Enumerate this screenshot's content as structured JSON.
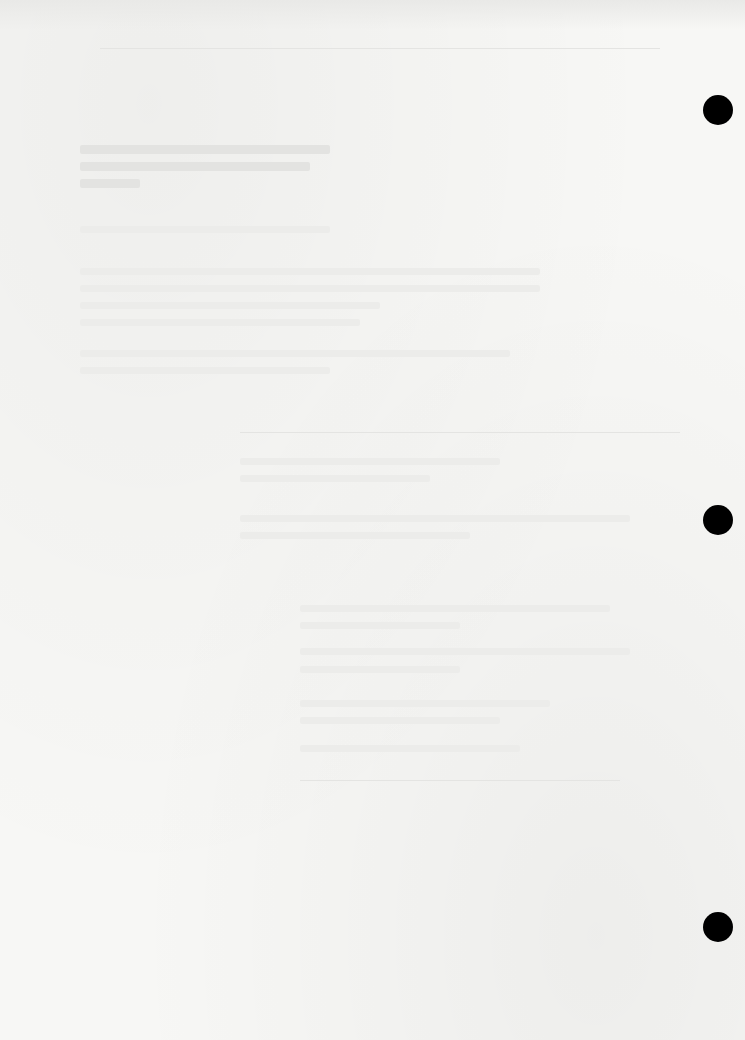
{
  "document": {
    "type": "faded scanned page",
    "text_legible": false
  },
  "punch_holes": [
    {
      "x": 703,
      "y": 95
    },
    {
      "x": 703,
      "y": 505
    },
    {
      "x": 703,
      "y": 912
    }
  ],
  "rules": [
    {
      "x": 100,
      "y": 48,
      "w": 560
    },
    {
      "x": 240,
      "y": 432,
      "w": 440
    },
    {
      "x": 300,
      "y": 780,
      "w": 320
    }
  ],
  "lines": [
    {
      "x": 80,
      "y": 145,
      "w": 250,
      "dark": true
    },
    {
      "x": 80,
      "y": 162,
      "w": 230,
      "dark": true
    },
    {
      "x": 80,
      "y": 179,
      "w": 60,
      "dark": true
    },
    {
      "x": 80,
      "y": 226,
      "w": 250
    },
    {
      "x": 80,
      "y": 268,
      "w": 460
    },
    {
      "x": 80,
      "y": 285,
      "w": 460
    },
    {
      "x": 80,
      "y": 302,
      "w": 300
    },
    {
      "x": 80,
      "y": 319,
      "w": 280
    },
    {
      "x": 80,
      "y": 350,
      "w": 430
    },
    {
      "x": 80,
      "y": 367,
      "w": 250
    },
    {
      "x": 240,
      "y": 458,
      "w": 260
    },
    {
      "x": 240,
      "y": 475,
      "w": 190
    },
    {
      "x": 240,
      "y": 515,
      "w": 390
    },
    {
      "x": 240,
      "y": 532,
      "w": 230
    },
    {
      "x": 300,
      "y": 605,
      "w": 310
    },
    {
      "x": 300,
      "y": 622,
      "w": 160
    },
    {
      "x": 300,
      "y": 648,
      "w": 330
    },
    {
      "x": 300,
      "y": 666,
      "w": 160
    },
    {
      "x": 300,
      "y": 700,
      "w": 250
    },
    {
      "x": 300,
      "y": 717,
      "w": 200
    },
    {
      "x": 300,
      "y": 745,
      "w": 220
    }
  ]
}
